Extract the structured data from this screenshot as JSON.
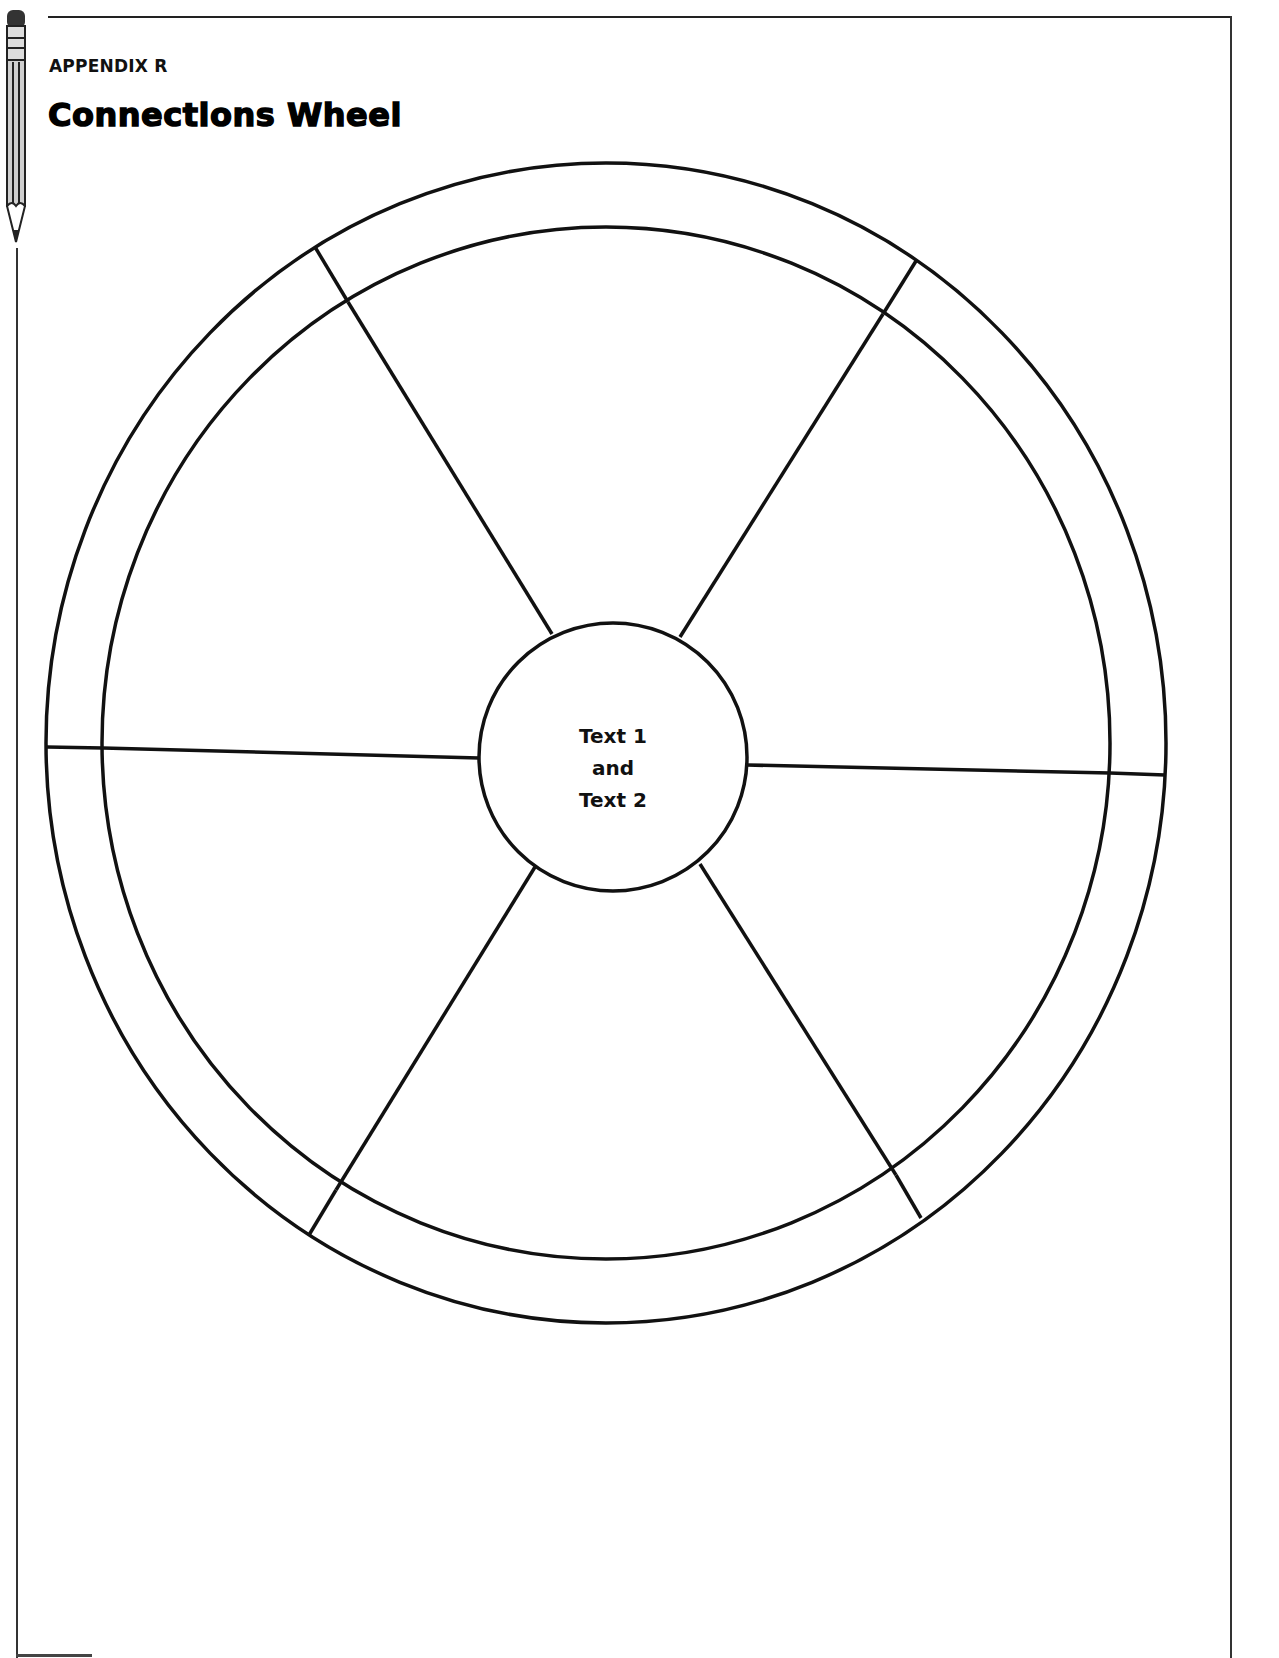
{
  "header": {
    "appendix_label": "APPENDIX R",
    "title": "Connections Wheel"
  },
  "wheel": {
    "center_text": {
      "line1": "Text 1",
      "line2": "and",
      "line3": "Text 2"
    },
    "segments": 6,
    "outer_ring_sections": 6
  },
  "icons": {
    "margin_icon": "pencil-icon"
  }
}
